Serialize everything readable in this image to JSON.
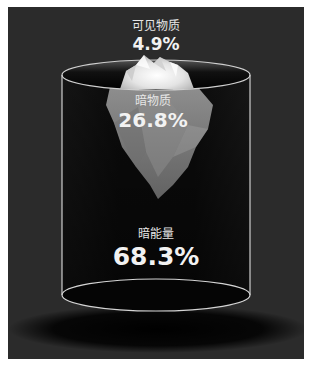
{
  "diagram": {
    "type": "iceberg-in-cylinder",
    "colors": {
      "background": "#2b2b2b",
      "cylinder_outline": "#d8d8d8",
      "text": "#f0f0f0"
    },
    "segments": [
      {
        "name": "可见物质",
        "value": "4.9%"
      },
      {
        "name": "暗物质",
        "value": "26.8%"
      },
      {
        "name": "暗能量",
        "value": "68.3%"
      }
    ]
  }
}
